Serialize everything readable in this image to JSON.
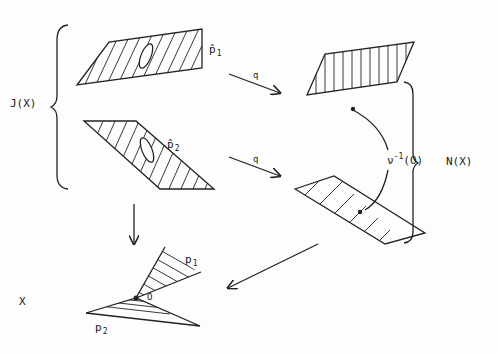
{
  "diagram": {
    "labels": {
      "JX": "J(X)",
      "NX": "N(X)",
      "X": "X",
      "q_top": "q",
      "q_bottom": "q",
      "p1hat_base": "p̂",
      "p1hat_sub": "1",
      "p2hat_base": "p̂",
      "p2hat_sub": "2",
      "p1_base": "p",
      "p1_sub": "1",
      "p2_base": "p",
      "p2_sub": "2",
      "origin": "O",
      "nu_base": "ν",
      "nu_sup": "-1",
      "nu_arg": "(O)"
    },
    "colors": {
      "ink": "#222222",
      "background": "#fdfdfd"
    }
  }
}
